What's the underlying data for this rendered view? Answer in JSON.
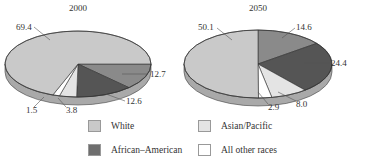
{
  "chart_data": [
    {
      "type": "pie",
      "title": "2000",
      "style": "3d-tilted",
      "slices": [
        {
          "label": "White",
          "value": 69.4,
          "color": "#c9c9c9"
        },
        {
          "label": "(medium gray, unlabeled in legend)",
          "value": 12.7,
          "color": "#8a8a8a"
        },
        {
          "label": "(dark gray)",
          "value": 12.6,
          "color": "#555555"
        },
        {
          "label": "Asian/Pacific",
          "value": 3.8,
          "color": "#e4e4e4"
        },
        {
          "label": "All other races",
          "value": 1.5,
          "color": "#ffffff"
        }
      ]
    },
    {
      "type": "pie",
      "title": "2050",
      "style": "3d-tilted",
      "slices": [
        {
          "label": "White",
          "value": 50.1,
          "color": "#c9c9c9"
        },
        {
          "label": "(medium gray, unlabeled in legend)",
          "value": 14.6,
          "color": "#8a8a8a"
        },
        {
          "label": "(dark gray)",
          "value": 24.4,
          "color": "#555555"
        },
        {
          "label": "Asian/Pacific",
          "value": 8.0,
          "color": "#e4e4e4"
        },
        {
          "label": "All other races",
          "value": 2.9,
          "color": "#ffffff"
        }
      ]
    }
  ],
  "legend": {
    "position": "bottom",
    "items": [
      {
        "label": "White",
        "color": "#c9c9c9"
      },
      {
        "label": "Asian/Pacific",
        "color": "#e4e4e4"
      },
      {
        "label": "African–American",
        "color": "#6e6e6e"
      },
      {
        "label": "All other races",
        "color": "#ffffff"
      }
    ]
  },
  "charts_layout": [
    {
      "title": "2000",
      "labels": [
        {
          "text": "69.4",
          "x": 16,
          "y": 30,
          "lx1": 34,
          "ly1": 27,
          "lx2": 50,
          "ly2": 40
        },
        {
          "text": "12.7",
          "x": 150,
          "y": 77,
          "lx1": 148,
          "ly1": 74,
          "lx2": 122,
          "ly2": 74
        },
        {
          "text": "12.6",
          "x": 126,
          "y": 104,
          "lx1": 125,
          "ly1": 101,
          "lx2": 106,
          "ly2": 94
        },
        {
          "text": "3.8",
          "x": 66,
          "y": 113,
          "lx1": 66,
          "ly1": 107,
          "lx2": 58,
          "ly2": 98
        },
        {
          "text": "1.5",
          "x": 26,
          "y": 113,
          "lx1": 34,
          "ly1": 107,
          "lx2": 44,
          "ly2": 97
        }
      ]
    },
    {
      "title": "2050",
      "labels": [
        {
          "text": "50.1",
          "x": 198,
          "y": 30,
          "lx1": 217,
          "ly1": 28,
          "lx2": 232,
          "ly2": 40
        },
        {
          "text": "14.6",
          "x": 296,
          "y": 30,
          "lx1": 295,
          "ly1": 28,
          "lx2": 282,
          "ly2": 38
        },
        {
          "text": "24.4",
          "x": 331,
          "y": 66,
          "lx1": 330,
          "ly1": 63,
          "lx2": 304,
          "ly2": 63
        },
        {
          "text": "8.0",
          "x": 296,
          "y": 107,
          "lx1": 296,
          "ly1": 101,
          "lx2": 278,
          "ly2": 92
        },
        {
          "text": "2.9",
          "x": 268,
          "y": 110,
          "lx1": 268,
          "ly1": 104,
          "lx2": 258,
          "ly2": 92
        }
      ]
    }
  ]
}
